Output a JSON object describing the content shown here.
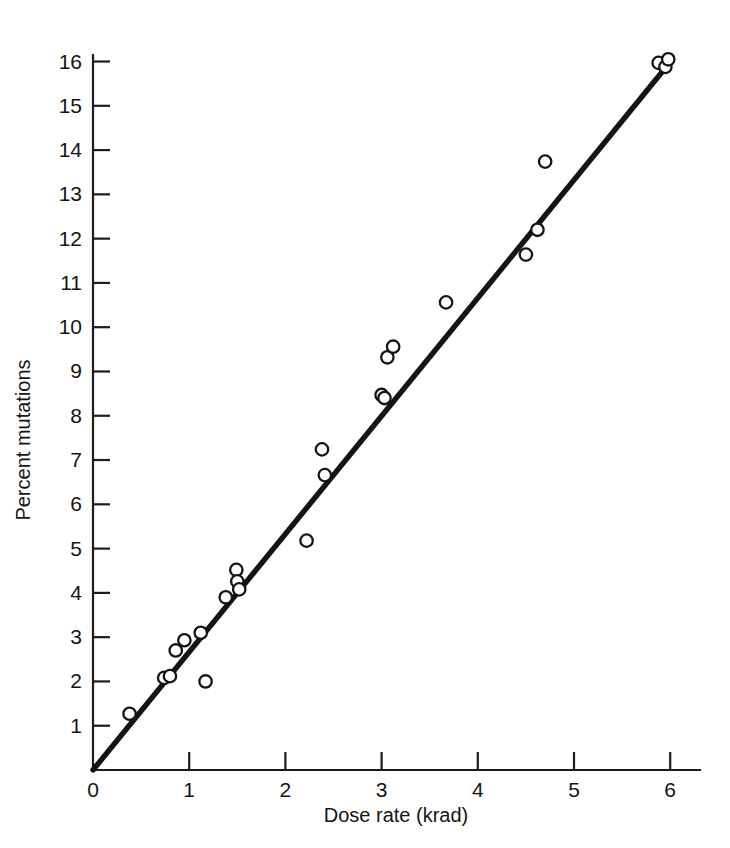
{
  "figure": {
    "background_color": "#ffffff",
    "ink_color": "#141414",
    "width": 730,
    "height": 848
  },
  "chart_data": {
    "type": "scatter",
    "title": "",
    "xlabel": "Dose rate (krad)",
    "ylabel": "Percent mutations",
    "xlim": [
      0,
      6.25
    ],
    "ylim": [
      0,
      16.4
    ],
    "xticks": [
      "0",
      "1",
      "2",
      "3",
      "4",
      "5",
      "6"
    ],
    "xtick_values": [
      0,
      1,
      2,
      3,
      4,
      5,
      6
    ],
    "yticks": [
      "1",
      "2",
      "3",
      "4",
      "5",
      "6",
      "7",
      "8",
      "9",
      "10",
      "11",
      "12",
      "13",
      "14",
      "15",
      "16"
    ],
    "ytick_values": [
      1,
      2,
      3,
      4,
      5,
      6,
      7,
      8,
      9,
      10,
      11,
      12,
      13,
      14,
      15,
      16
    ],
    "grid": false,
    "legend": false,
    "marker": "open-circle",
    "points": [
      {
        "x": 0.38,
        "y": 1.27
      },
      {
        "x": 0.74,
        "y": 2.08
      },
      {
        "x": 0.8,
        "y": 2.12
      },
      {
        "x": 0.86,
        "y": 2.7
      },
      {
        "x": 0.95,
        "y": 2.93
      },
      {
        "x": 1.12,
        "y": 3.1
      },
      {
        "x": 1.17,
        "y": 2.0
      },
      {
        "x": 1.38,
        "y": 3.9
      },
      {
        "x": 1.49,
        "y": 4.52
      },
      {
        "x": 1.5,
        "y": 4.26
      },
      {
        "x": 1.52,
        "y": 4.08
      },
      {
        "x": 2.22,
        "y": 5.18
      },
      {
        "x": 2.38,
        "y": 7.24
      },
      {
        "x": 2.41,
        "y": 6.66
      },
      {
        "x": 3.0,
        "y": 8.47
      },
      {
        "x": 3.03,
        "y": 8.4
      },
      {
        "x": 3.06,
        "y": 9.32
      },
      {
        "x": 3.12,
        "y": 9.56
      },
      {
        "x": 3.67,
        "y": 10.56
      },
      {
        "x": 4.5,
        "y": 11.64
      },
      {
        "x": 4.62,
        "y": 12.2
      },
      {
        "x": 4.7,
        "y": 13.74
      },
      {
        "x": 5.88,
        "y": 15.97
      },
      {
        "x": 5.95,
        "y": 15.88
      },
      {
        "x": 5.98,
        "y": 16.05
      }
    ],
    "fit_line": {
      "label": "",
      "intercept": 0.0,
      "slope": 2.665,
      "x_start": 0.0,
      "y_start": 0.0,
      "x_end": 6.0,
      "y_end": 15.99
    }
  },
  "caption": {
    "partial_text": ""
  }
}
